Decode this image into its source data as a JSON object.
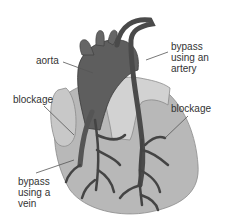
{
  "diagram": {
    "labels": {
      "aorta": "aorta",
      "bypass_artery": "bypass\nusing an\nartery",
      "blockage_left": "blockage",
      "blockage_right": "blockage",
      "bypass_vein": "bypass\nusing a\nvein"
    },
    "colors": {
      "background": "#ffffff",
      "heart_fill": "#b4b4b4",
      "heart_light": "#cfcfcf",
      "aorta_fill": "#5a5a5a",
      "vessel": "#444444",
      "label_text": "#333333",
      "leader_line": "#555555"
    }
  }
}
